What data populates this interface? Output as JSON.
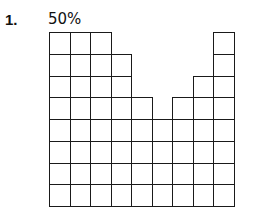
{
  "problem": {
    "number": "1.",
    "percent_label": "50%"
  },
  "figure": {
    "rows": 8,
    "columns": 9,
    "column_heights": [
      8,
      8,
      8,
      7,
      5,
      4,
      5,
      6,
      8
    ],
    "line_color": "#1a1a1a"
  }
}
